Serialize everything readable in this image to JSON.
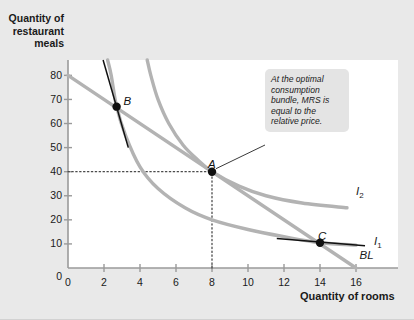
{
  "figure": {
    "background_color": "#e9e9e9",
    "plot_background_color": "#ffffff"
  },
  "annotation": {
    "text": "At the optimal consumption bundle, MRS is equal to the relative price.",
    "target_point": "A",
    "background_color": "#e4e4e4"
  },
  "chart_data": {
    "type": "line",
    "title": "",
    "xlabel": "Quantity of rooms",
    "ylabel": "Quantity of restaurant meals",
    "xlim": [
      0,
      18
    ],
    "ylim": [
      0,
      88
    ],
    "xticks": [
      0,
      2,
      4,
      6,
      8,
      10,
      12,
      14,
      16
    ],
    "yticks": [
      0,
      10,
      20,
      30,
      40,
      50,
      60,
      70,
      80
    ],
    "grid": false,
    "legend": "inline-labels",
    "axis_color": "#9a9a9a",
    "curve_color": "#b3b3b3",
    "tangent_color": "#111111",
    "series": [
      {
        "name": "BL",
        "label": "BL",
        "role": "budget-line",
        "type": "straight",
        "color": "#b3b3b3",
        "label_position": [
          16.2,
          4.5
        ],
        "points": [
          [
            0,
            80
          ],
          [
            16,
            0
          ]
        ]
      },
      {
        "name": "I1",
        "label": "I",
        "label_subscript": "1",
        "role": "indifference-curve-lower",
        "type": "hyperbola",
        "color": "#b3b3b3",
        "label_position": [
          17.0,
          10.5
        ],
        "points": [
          [
            2.2,
            88
          ],
          [
            2.4,
            80
          ],
          [
            2.7,
            67
          ],
          [
            3.2,
            55
          ],
          [
            4.0,
            42
          ],
          [
            5.0,
            33
          ],
          [
            6.5,
            25
          ],
          [
            8.0,
            20
          ],
          [
            10.0,
            16
          ],
          [
            12.0,
            13
          ],
          [
            14.0,
            10.5
          ],
          [
            16.0,
            9.5
          ]
        ]
      },
      {
        "name": "I2",
        "label": "I",
        "label_subscript": "2",
        "role": "indifference-curve-optimal",
        "type": "hyperbola",
        "color": "#b3b3b3",
        "label_position": [
          16.0,
          31
        ],
        "points": [
          [
            4.4,
            88
          ],
          [
            4.6,
            80
          ],
          [
            5.0,
            70
          ],
          [
            5.6,
            60
          ],
          [
            6.4,
            51
          ],
          [
            7.2,
            45
          ],
          [
            8.0,
            40
          ],
          [
            9.5,
            34
          ],
          [
            11.0,
            30
          ],
          [
            13.0,
            27
          ],
          [
            15.5,
            25
          ]
        ]
      }
    ],
    "tangent_lines": [
      {
        "name": "tangent-at-B",
        "at_point": "B",
        "color": "#111111",
        "points": [
          [
            1.95,
            88
          ],
          [
            3.35,
            50
          ]
        ]
      },
      {
        "name": "tangent-at-C",
        "at_point": "C",
        "color": "#111111",
        "points": [
          [
            11.6,
            12.2
          ],
          [
            16.5,
            9.2
          ]
        ]
      }
    ],
    "points": [
      {
        "label": "A",
        "x": 8,
        "y": 40,
        "label_offset": [
          -4,
          -14
        ],
        "marker": "filled-circle"
      },
      {
        "label": "B",
        "x": 2.7,
        "y": 67,
        "label_offset": [
          7,
          -12
        ],
        "marker": "filled-circle"
      },
      {
        "label": "C",
        "x": 14,
        "y": 10.5,
        "label_offset": [
          -2,
          -13
        ],
        "marker": "filled-circle"
      }
    ],
    "guide_lines": [
      {
        "name": "horizontal-guide-A",
        "from": [
          0,
          40
        ],
        "to": [
          8,
          40
        ],
        "style": "dotted"
      },
      {
        "name": "vertical-guide-A",
        "from": [
          8,
          0
        ],
        "to": [
          8,
          40
        ],
        "style": "dotted"
      }
    ]
  }
}
